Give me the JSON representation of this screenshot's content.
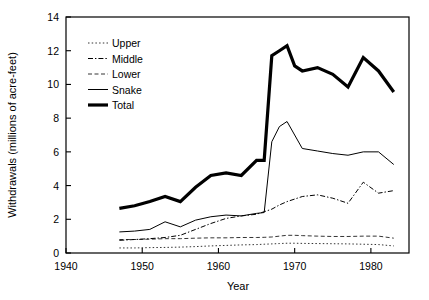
{
  "chart_data": {
    "type": "line",
    "title": "",
    "xlabel": "Year",
    "ylabel": "Withdrawals (millions of acre-feet)",
    "xlim": [
      1940,
      1985
    ],
    "ylim": [
      0,
      14
    ],
    "xticks": [
      1940,
      1950,
      1960,
      1970,
      1980
    ],
    "yticks": [
      0,
      2,
      4,
      6,
      8,
      10,
      12,
      14
    ],
    "grid": false,
    "legend_position": "upper-left-inside",
    "x": [
      1947,
      1949,
      1951,
      1953,
      1955,
      1957,
      1959,
      1961,
      1963,
      1965,
      1966,
      1967,
      1968,
      1969,
      1970,
      1971,
      1973,
      1975,
      1977,
      1979,
      1981,
      1983
    ],
    "series": [
      {
        "name": "Upper",
        "style": "dotted",
        "width": 0.8,
        "color": "#000000",
        "values": [
          0.3,
          0.3,
          0.32,
          0.33,
          0.35,
          0.38,
          0.42,
          0.45,
          0.48,
          0.5,
          0.52,
          0.54,
          0.56,
          0.58,
          0.58,
          0.57,
          0.56,
          0.55,
          0.54,
          0.52,
          0.5,
          0.42
        ]
      },
      {
        "name": "Middle",
        "style": "dash-dot",
        "width": 1.0,
        "color": "#000000",
        "values": [
          0.75,
          0.8,
          0.85,
          0.92,
          1.05,
          1.4,
          1.75,
          2.05,
          2.2,
          2.3,
          2.45,
          2.6,
          2.85,
          3.05,
          3.2,
          3.35,
          3.45,
          3.25,
          2.95,
          4.2,
          3.55,
          3.7
        ]
      },
      {
        "name": "Lower",
        "style": "dashed",
        "width": 0.8,
        "color": "#000000",
        "values": [
          0.8,
          0.8,
          0.82,
          0.85,
          0.85,
          0.88,
          0.9,
          0.9,
          0.92,
          0.92,
          0.93,
          0.95,
          1.0,
          1.05,
          1.05,
          1.03,
          1.0,
          0.98,
          0.98,
          1.0,
          1.0,
          0.88
        ]
      },
      {
        "name": "Snake",
        "style": "solid",
        "width": 1.0,
        "color": "#000000",
        "values": [
          1.25,
          1.3,
          1.4,
          1.85,
          1.55,
          1.95,
          2.15,
          2.25,
          2.2,
          2.35,
          2.4,
          6.6,
          7.5,
          7.8,
          7.0,
          6.2,
          6.05,
          5.9,
          5.8,
          6.0,
          6.0,
          5.25
        ]
      },
      {
        "name": "Total",
        "style": "solid",
        "width": 3.2,
        "color": "#000000",
        "values": [
          2.65,
          2.8,
          3.05,
          3.35,
          3.05,
          3.9,
          4.6,
          4.75,
          4.6,
          5.5,
          5.5,
          11.7,
          12.0,
          12.3,
          11.1,
          10.8,
          11.0,
          10.6,
          9.85,
          11.6,
          10.8,
          9.55
        ]
      }
    ]
  },
  "legend": {
    "items": [
      {
        "label": "Upper"
      },
      {
        "label": "Middle"
      },
      {
        "label": "Lower"
      },
      {
        "label": "Snake"
      },
      {
        "label": "Total"
      }
    ]
  },
  "axis": {
    "x_label": "Year",
    "y_label": "Withdrawals (millions of acre-feet)",
    "x_tick_labels": [
      "1940",
      "1950",
      "1960",
      "1970",
      "1980"
    ],
    "y_tick_labels": [
      "0",
      "2",
      "4",
      "6",
      "8",
      "10",
      "12",
      "14"
    ]
  }
}
